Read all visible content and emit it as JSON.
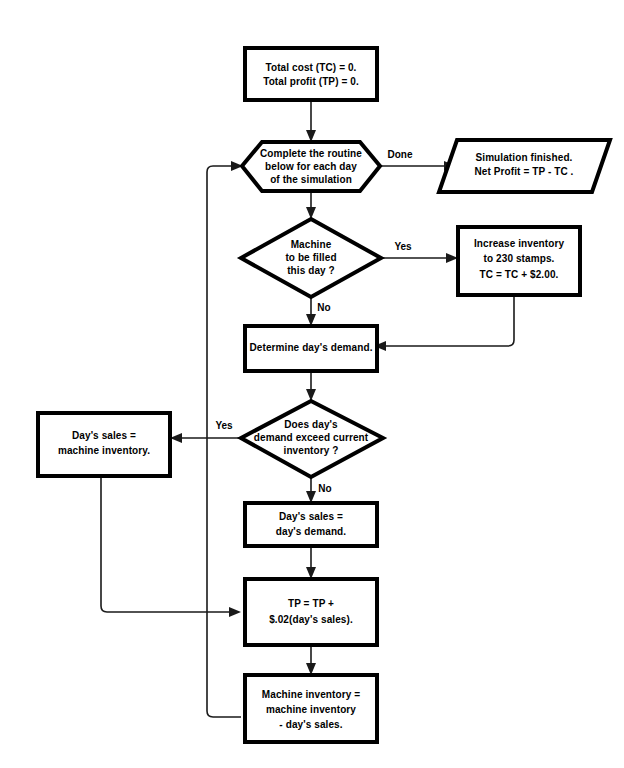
{
  "diagram": {
    "colors": {
      "background": "#ffffff",
      "shape_stroke": "#000000",
      "shape_fill": "#ffffff",
      "connector": "#1a1a1a",
      "text": "#000000"
    }
  },
  "nodes": {
    "init": {
      "shape": "process",
      "lines": [
        "Total cost (TC) = 0.",
        "Total profit (TP) = 0."
      ]
    },
    "loop_header": {
      "shape": "preparation",
      "lines": [
        "Complete the routine",
        "below for each day",
        "of the simulation"
      ]
    },
    "finish": {
      "shape": "parallelogram",
      "lines": [
        "Simulation finished.",
        "Net Profit = TP - TC ."
      ]
    },
    "fill_decision": {
      "shape": "decision",
      "lines": [
        "Machine",
        "to be filled",
        "this day ?"
      ]
    },
    "increase_inventory": {
      "shape": "process",
      "lines": [
        "Increase inventory",
        "to 230 stamps.",
        "TC = TC + $2.00."
      ]
    },
    "determine_demand": {
      "shape": "process",
      "lines": [
        "Determine day's demand."
      ]
    },
    "demand_decision": {
      "shape": "decision",
      "lines": [
        "Does day's",
        "demand exceed current",
        "inventory ?"
      ]
    },
    "sales_eq_inventory": {
      "shape": "process",
      "lines": [
        "Day's sales =",
        "machine inventory."
      ]
    },
    "sales_eq_demand": {
      "shape": "process",
      "lines": [
        "Day's sales =",
        "day's demand."
      ]
    },
    "update_profit": {
      "shape": "process",
      "lines": [
        "TP = TP +",
        "$.02(day's sales)."
      ]
    },
    "update_inventory": {
      "shape": "process",
      "lines": [
        "Machine inventory =",
        "machine inventory",
        "- day's sales."
      ]
    }
  },
  "edge_labels": {
    "done": "Done",
    "fill_yes": "Yes",
    "fill_no": "No",
    "demand_yes": "Yes",
    "demand_no": "No"
  }
}
